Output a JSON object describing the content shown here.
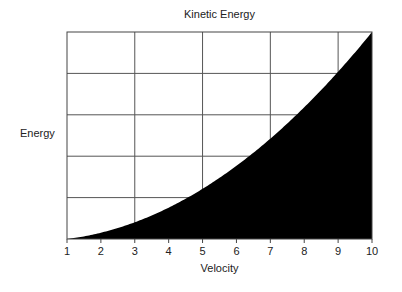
{
  "chart_data": {
    "type": "area",
    "title": "Kinetic Energy",
    "xlabel": "Velocity",
    "ylabel": "Energy",
    "x": [
      1,
      2,
      3,
      4,
      5,
      6,
      7,
      8,
      9,
      10
    ],
    "series": [
      {
        "name": "Kinetic Energy (relative, ∝ v²)",
        "values": [
          0,
          3,
          8,
          15,
          24,
          35,
          48,
          63,
          80,
          99
        ],
        "fill": "#000000"
      }
    ],
    "xticks": [
      "1",
      "2",
      "3",
      "4",
      "5",
      "6",
      "7",
      "8",
      "9",
      "10"
    ],
    "xlim": [
      1,
      10
    ],
    "ylim": [
      0,
      99
    ],
    "yticks_visible": false,
    "grid": {
      "vertical_at": [
        3,
        5,
        7,
        9
      ],
      "horizontal_divisions": 5
    },
    "legend": "none"
  },
  "colors": {
    "fill": "#000000",
    "grid": "#555555",
    "background": "#ffffff"
  }
}
